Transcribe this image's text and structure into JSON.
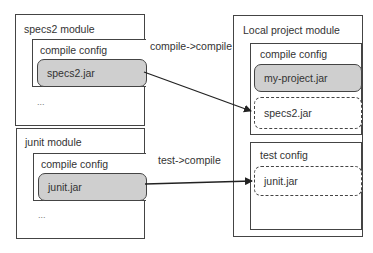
{
  "modules": {
    "specs2": {
      "title": "specs2 module",
      "config": {
        "title": "compile config",
        "jar": "specs2.jar"
      },
      "ellipsis": "..."
    },
    "junit": {
      "title": "junit module",
      "config": {
        "title": "compile config",
        "jar": "junit.jar"
      },
      "ellipsis": "..."
    },
    "local": {
      "title": "Local project module",
      "compile_config": {
        "title": "compile config",
        "jars": [
          "my-project.jar",
          "specs2.jar"
        ]
      },
      "test_config": {
        "title": "test config",
        "jars": [
          "junit.jar"
        ]
      }
    }
  },
  "edges": [
    {
      "label": "compile->compile",
      "from": "specs2.jar",
      "to": "specs2.jar (local compile config)"
    },
    {
      "label": "test->compile",
      "from": "junit.jar",
      "to": "junit.jar (local test config)"
    }
  ],
  "colors": {
    "jar_fill": "#cfcfcf",
    "stroke": "#444444"
  }
}
